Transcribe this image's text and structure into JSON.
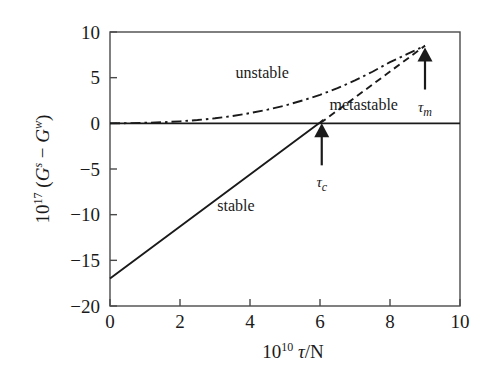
{
  "chart_data": {
    "type": "line",
    "title": "",
    "xlabel": "10^10 τ/N",
    "ylabel": "10^17 (G^s − G^w)",
    "xlabel_parts": {
      "base": "10",
      "exp": "10",
      "tail": "τ/N"
    },
    "ylabel_parts": {
      "base": "10",
      "exp": "17",
      "open": " (",
      "g1": "G",
      "g1sup": "s",
      "minus": " − ",
      "g2": "G",
      "g2sup": "w",
      "close": ")"
    },
    "xlim": [
      0,
      10
    ],
    "ylim": [
      -20,
      10
    ],
    "xticks": [
      "0",
      "2",
      "4",
      "6",
      "8",
      "10"
    ],
    "xtick_values": [
      0,
      2,
      4,
      6,
      8,
      10
    ],
    "yticks": [
      "10",
      "5",
      "0",
      "−5",
      "−10",
      "−15",
      "−20"
    ],
    "ytick_values": [
      10,
      5,
      0,
      -5,
      -10,
      -15,
      -20
    ],
    "grid": false,
    "legend_position": "inline-labels",
    "frame": true,
    "series": [
      {
        "name": "stable",
        "style": "solid",
        "label": "stable",
        "label_x": 3.6,
        "label_y": -9.6,
        "x": [
          0,
          1,
          2,
          3,
          4,
          5,
          6,
          6.1
        ],
        "values": [
          -17.0,
          -14.15,
          -11.3,
          -8.45,
          -5.6,
          -2.75,
          0.1,
          0.4
        ]
      },
      {
        "name": "metastable",
        "style": "solid",
        "label": "metastable",
        "label_x": 7.25,
        "label_y": 1.45,
        "x": [
          0,
          10
        ],
        "values": [
          0,
          0
        ]
      },
      {
        "name": "unstable",
        "style": "dash-dot",
        "label": "unstable",
        "label_x": 4.35,
        "label_y": 5.0,
        "x": [
          0,
          0.5,
          1,
          1.5,
          2,
          2.5,
          3,
          3.5,
          4,
          4.5,
          5,
          5.5,
          6,
          6.5,
          7,
          7.5,
          8,
          8.5,
          9
        ],
        "values": [
          0.0,
          0.02,
          0.06,
          0.12,
          0.22,
          0.36,
          0.55,
          0.8,
          1.12,
          1.5,
          1.95,
          2.5,
          3.12,
          3.85,
          4.7,
          5.65,
          6.7,
          7.6,
          8.5
        ]
      },
      {
        "name": "metastable-branch",
        "style": "dashed",
        "label": "",
        "x": [
          6.0,
          9
        ],
        "values": [
          0.0,
          8.5
        ]
      }
    ],
    "annotations": [
      {
        "name": "tau-c",
        "label": "τ",
        "sub": "c",
        "x": 6.05,
        "y": 0,
        "arrow": "up",
        "arrow_length_px": 42,
        "label_offset_px": 22
      },
      {
        "name": "tau-m",
        "label": "τ",
        "sub": "m",
        "x": 9.0,
        "y": 8.3,
        "arrow": "up",
        "arrow_length_px": 42,
        "label_offset_px": 22
      }
    ],
    "colors": {
      "line": "#1a1a1a",
      "frame": "#4a4a4a",
      "text": "#1a1a1a",
      "background": "#ffffff"
    }
  }
}
